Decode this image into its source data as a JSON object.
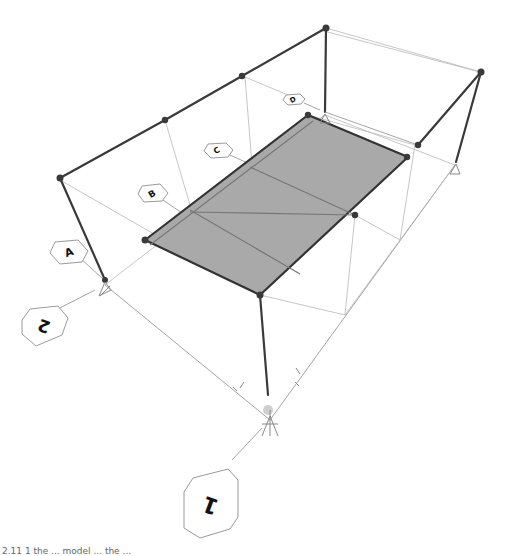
{
  "diagram": {
    "type": "3d-structural-frame",
    "colors": {
      "background": "#ffffff",
      "frame": "#3a3a3a",
      "slab": "#a9a9a9",
      "grid": "#9a9a9a"
    },
    "grid_bubbles": {
      "letters": [
        {
          "id": "A",
          "label": "A"
        },
        {
          "id": "B",
          "label": "B"
        },
        {
          "id": "C",
          "label": "C"
        },
        {
          "id": "D",
          "label": "D"
        }
      ],
      "numbers": [
        {
          "id": "1",
          "label": "1"
        },
        {
          "id": "2",
          "label": "2"
        }
      ]
    },
    "caption": "2.11 1 the ... model ... the ..."
  }
}
